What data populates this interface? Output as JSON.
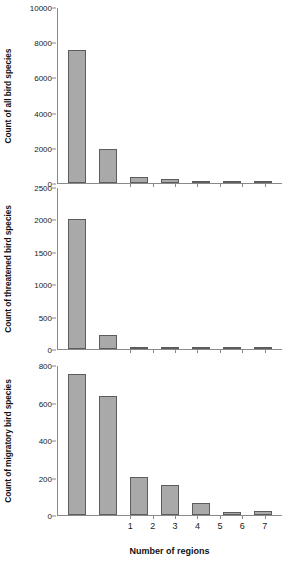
{
  "chart_data": [
    {
      "type": "bar",
      "title": "",
      "panel_index": 0,
      "xlabel": "",
      "ylabel": "Count of all bird species",
      "categories": [
        "1",
        "2",
        "3",
        "4",
        "5",
        "6",
        "7"
      ],
      "values": [
        7620,
        1950,
        330,
        210,
        80,
        40,
        25
      ],
      "ylim": [
        0,
        10000
      ],
      "yticks": [
        0,
        2000,
        4000,
        6000,
        8000,
        10000
      ],
      "ytick_labels": [
        "0",
        "2000",
        "4000",
        "6000",
        "8000",
        "10000"
      ],
      "grid": false,
      "legend": "none",
      "bar_fill": "#a9a9a9",
      "bar_edge": "#5c5c5c",
      "show_xtick_labels": false
    },
    {
      "type": "bar",
      "title": "",
      "panel_index": 1,
      "xlabel": "",
      "ylabel": "Count of threatened bird species",
      "categories": [
        "1",
        "2",
        "3",
        "4",
        "5",
        "6",
        "7"
      ],
      "values": [
        2020,
        215,
        20,
        20,
        3,
        2,
        1
      ],
      "ylim": [
        0,
        2500
      ],
      "yticks": [
        0,
        500,
        1000,
        1500,
        2000,
        2500
      ],
      "ytick_labels": [
        "0",
        "500",
        "1000",
        "1500",
        "2000",
        "2500"
      ],
      "grid": false,
      "legend": "none",
      "bar_fill": "#a9a9a9",
      "bar_edge": "#5c5c5c",
      "show_xtick_labels": false
    },
    {
      "type": "bar",
      "title": "",
      "panel_index": 2,
      "xlabel": "Number of regions",
      "ylabel": "Count of migratory bird species",
      "categories": [
        "1",
        "2",
        "3",
        "4",
        "5",
        "6",
        "7"
      ],
      "values": [
        755,
        640,
        205,
        160,
        62,
        18,
        20
      ],
      "ylim": [
        0,
        800
      ],
      "yticks": [
        0,
        200,
        400,
        600,
        800
      ],
      "ytick_labels": [
        "0",
        "200",
        "400",
        "600",
        "800"
      ],
      "grid": false,
      "legend": "none",
      "bar_fill": "#a9a9a9",
      "bar_edge": "#5c5c5c",
      "show_xtick_labels": true
    }
  ],
  "figure": {
    "xlabel": "Number of regions",
    "background": "#ffffff",
    "panel_count": 3
  }
}
